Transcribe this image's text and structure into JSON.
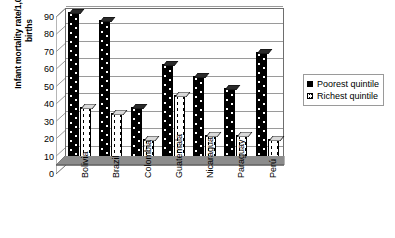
{
  "chart_data": {
    "type": "bar",
    "title": "",
    "xlabel": "",
    "ylabel": "Infant mortality rate/1,000 live births",
    "ylabel_lines": [
      "Infant mortality rate/1,000 live",
      "births"
    ],
    "categories": [
      "Bolivia",
      "Brazil",
      "Colombia",
      "Guatemala",
      "Nicaragua",
      "Paraguay",
      "Perú"
    ],
    "series": [
      {
        "name": "Poorest quintile",
        "values": [
          88,
          83,
          33,
          58,
          51,
          44,
          65
        ],
        "color": "#000000",
        "pattern": "dotted-dark"
      },
      {
        "name": "Richest quintile",
        "values": [
          33,
          30,
          15,
          40,
          17,
          17,
          15
        ],
        "color": "#ffffff",
        "pattern": "dashed-light"
      }
    ],
    "ylim": [
      0,
      90
    ],
    "ytick_values": [
      0,
      10,
      20,
      30,
      40,
      50,
      60,
      70,
      80,
      90
    ],
    "ytick_labels": [
      "0",
      "10",
      "20",
      "30",
      "40",
      "50",
      "60",
      "70",
      "80",
      "90"
    ],
    "grid": true,
    "grid_axis": "y",
    "legend_position": "right",
    "style": "3d-column",
    "colors": {
      "plot_background": "#ffffff",
      "grid": "#9a9a9a",
      "axis": "#6e6e6e",
      "floor": "#808080",
      "floor_top": "#a6a6a6",
      "sidewall": "#ffffff",
      "poorest": "#000000",
      "richest": "#ffffff",
      "text": "#000000"
    }
  },
  "legend": {
    "entries": [
      {
        "label": "Poorest quintile"
      },
      {
        "label": "Richest quintile"
      }
    ]
  }
}
